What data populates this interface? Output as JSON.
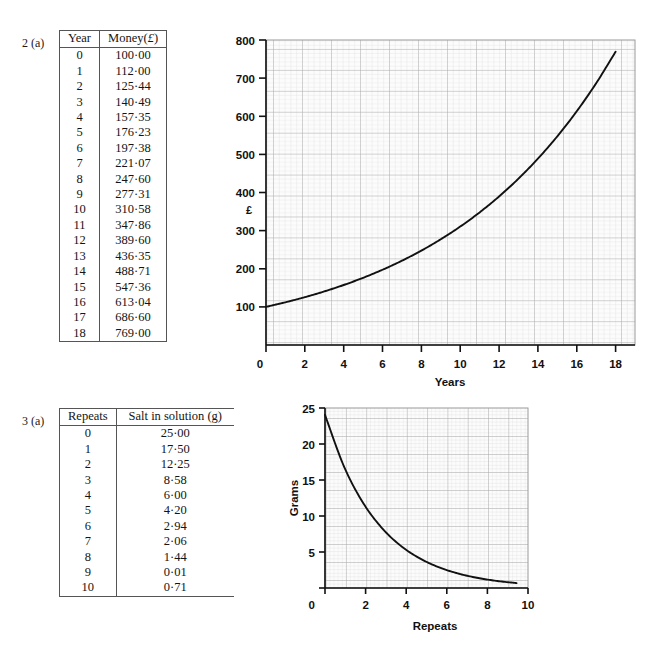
{
  "page": {
    "background": "#ffffff",
    "ink": "#111111"
  },
  "exercises": [
    {
      "label": "2 (a)",
      "table": {
        "headers": [
          "Year",
          "Money(£)"
        ],
        "header_money_prefix": "Money(",
        "header_money_symbol": "£",
        "header_money_suffix": ")",
        "rows": [
          [
            "0",
            "100·00"
          ],
          [
            "1",
            "112·00"
          ],
          [
            "2",
            "125·44"
          ],
          [
            "3",
            "140·49"
          ],
          [
            "4",
            "157·35"
          ],
          [
            "5",
            "176·23"
          ],
          [
            "6",
            "197·38"
          ],
          [
            "7",
            "221·07"
          ],
          [
            "8",
            "247·60"
          ],
          [
            "9",
            "277·31"
          ],
          [
            "10",
            "310·58"
          ],
          [
            "11",
            "347·86"
          ],
          [
            "12",
            "389·60"
          ],
          [
            "13",
            "436·35"
          ],
          [
            "14",
            "488·71"
          ],
          [
            "15",
            "547·36"
          ],
          [
            "16",
            "613·04"
          ],
          [
            "17",
            "686·60"
          ],
          [
            "18",
            "769·00"
          ]
        ]
      }
    },
    {
      "label": "3 (a)",
      "table": {
        "headers": [
          "Repeats",
          "Salt in solution (g)"
        ],
        "rows": [
          [
            "0",
            "25·00"
          ],
          [
            "1",
            "17·50"
          ],
          [
            "2",
            "12·25"
          ],
          [
            "3",
            "8·58"
          ],
          [
            "4",
            "6·00"
          ],
          [
            "5",
            "4·20"
          ],
          [
            "6",
            "2·94"
          ],
          [
            "7",
            "2·06"
          ],
          [
            "8",
            "1·44"
          ],
          [
            "9",
            "0·01"
          ],
          [
            "10",
            "0·71"
          ]
        ]
      }
    }
  ],
  "chart_data": [
    {
      "type": "line",
      "name": "compound-growth",
      "title": "",
      "xlabel": "Years",
      "ylabel": "£",
      "ylabel_position": "above-axis",
      "xlim": [
        0,
        19
      ],
      "ylim": [
        0,
        800
      ],
      "xticks": [
        0,
        2,
        4,
        6,
        8,
        10,
        12,
        14,
        16,
        18
      ],
      "xtick_labels": [
        "0",
        "2",
        "4",
        "6",
        "8",
        "10",
        "12",
        "14",
        "16",
        "18"
      ],
      "yticks": [
        100,
        200,
        300,
        400,
        500,
        600,
        700,
        800
      ],
      "ytick_labels": [
        "100",
        "200",
        "300",
        "400",
        "500",
        "600",
        "700",
        "800"
      ],
      "grid": "graph-paper",
      "grid_minor_color": "#d8d8d8",
      "grid_major_color": "#a8a8a8",
      "line_color": "#111111",
      "legend": "none",
      "x": [
        0,
        1,
        2,
        3,
        4,
        5,
        6,
        7,
        8,
        9,
        10,
        11,
        12,
        13,
        14,
        15,
        16,
        17,
        18
      ],
      "y": [
        100.0,
        112.0,
        125.44,
        140.49,
        157.35,
        176.23,
        197.38,
        221.07,
        247.6,
        277.31,
        310.58,
        347.86,
        389.6,
        436.35,
        488.71,
        547.36,
        613.04,
        686.6,
        769.0
      ]
    },
    {
      "type": "line",
      "name": "salt-decay",
      "title": "",
      "xlabel": "Repeats",
      "ylabel": "Grams",
      "ylabel_position": "rotated-left",
      "xlim": [
        0,
        10.6
      ],
      "ylim": [
        0,
        26
      ],
      "xticks": [
        0,
        2,
        4,
        6,
        8,
        10
      ],
      "xtick_labels": [
        "0",
        "2",
        "4",
        "6",
        "8",
        "10"
      ],
      "yticks": [
        0,
        5,
        10,
        15,
        20,
        25
      ],
      "ytick_labels": [
        "0",
        "5",
        "10",
        "15",
        "20",
        "25"
      ],
      "grid": "graph-paper",
      "grid_minor_color": "#d8d8d8",
      "grid_major_color": "#a8a8a8",
      "line_color": "#111111",
      "legend": "none",
      "x": [
        0,
        1,
        2,
        3,
        4,
        5,
        6,
        7,
        8,
        9,
        10
      ],
      "y": [
        25.0,
        17.5,
        12.25,
        8.58,
        6.0,
        4.2,
        2.94,
        2.06,
        1.44,
        1.01,
        0.71
      ]
    }
  ]
}
